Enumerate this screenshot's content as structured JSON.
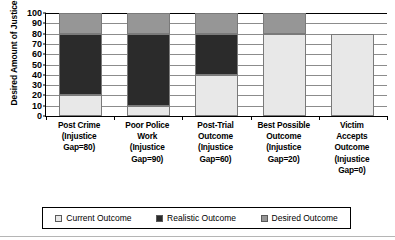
{
  "chart_data": {
    "type": "bar",
    "subtype": "stacked-column",
    "title": "",
    "xlabel": "",
    "ylabel": "Desired Amount of Justice",
    "ylim": [
      0,
      100
    ],
    "ytick_step": 10,
    "yticks": [
      "100",
      "90",
      "80",
      "70",
      "60",
      "50",
      "40",
      "30",
      "20",
      "10",
      "0"
    ],
    "grid": true,
    "legend_position": "bottom",
    "categories": [
      "Post Crime (Injustice Gap=80)",
      "Poor Police Work (Injustice Gap=90)",
      "Post-Trial Outcome (Injustice Gap=60)",
      "Best Possible Outcome (Injustice Gap=20)",
      "Victim Accepts Outcome (Injustice Gap=0)"
    ],
    "category_lines": [
      [
        "Post Crime",
        "(Injustice",
        "Gap=80)"
      ],
      [
        "Poor Police",
        "Work",
        "(Injustice",
        "Gap=90)"
      ],
      [
        "Post-Trial",
        "Outcome",
        "(Injustice",
        "Gap=60)"
      ],
      [
        "Best Possible",
        "Outcome",
        "(Injustice",
        "Gap=20)"
      ],
      [
        "Victim",
        "Accepts",
        "Outcome",
        "(Injustice",
        "Gap=0)"
      ]
    ],
    "series": [
      {
        "name": "Current Outcome",
        "color": "#e8e8e8",
        "values": [
          20,
          10,
          40,
          80,
          80
        ]
      },
      {
        "name": "Realistic Outcome",
        "color": "#2b2b2b",
        "values": [
          60,
          70,
          40,
          0,
          0
        ]
      },
      {
        "name": "Desired Outcome",
        "color": "#969696",
        "values": [
          20,
          20,
          20,
          20,
          0
        ]
      }
    ],
    "segment_bounds": [
      [
        {
          "from": 0,
          "to": 20
        },
        {
          "from": 20,
          "to": 80
        },
        {
          "from": 80,
          "to": 100
        }
      ],
      [
        {
          "from": 0,
          "to": 10
        },
        {
          "from": 10,
          "to": 80
        },
        {
          "from": 80,
          "to": 100
        }
      ],
      [
        {
          "from": 0,
          "to": 40
        },
        {
          "from": 40,
          "to": 80
        },
        {
          "from": 80,
          "to": 100
        }
      ],
      [
        {
          "from": 0,
          "to": 80
        },
        {
          "from": 80,
          "to": 80
        },
        {
          "from": 80,
          "to": 100
        }
      ],
      [
        {
          "from": 0,
          "to": 80
        },
        {
          "from": 80,
          "to": 80
        },
        {
          "from": 100,
          "to": 100
        }
      ]
    ],
    "injustice_gaps": [
      80,
      90,
      60,
      20,
      0
    ]
  },
  "legend": {
    "items": [
      {
        "label": "Current Outcome",
        "color": "#e8e8e8"
      },
      {
        "label": "Realistic Outcome",
        "color": "#2b2b2b"
      },
      {
        "label": "Desired Outcome",
        "color": "#969696"
      }
    ]
  },
  "axis": {
    "y_title": "Desired Amount of Justice"
  }
}
